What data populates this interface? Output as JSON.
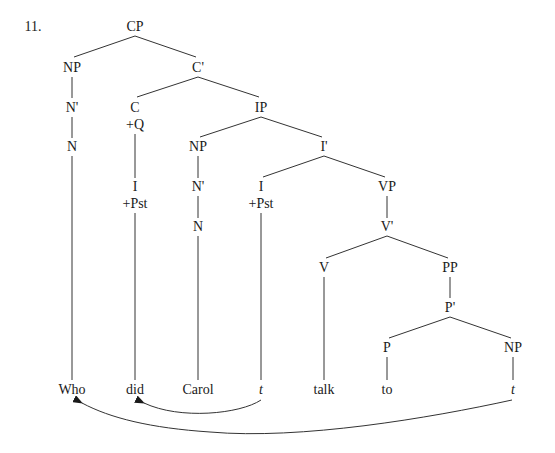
{
  "example_number": "11.",
  "colors": {
    "line": "#333333",
    "text": "#1a1a1a",
    "background": "#ffffff"
  },
  "nodes": {
    "cp": {
      "label": "CP",
      "x": 135,
      "y": 27
    },
    "np_spec_cp": {
      "label": "NP",
      "x": 72,
      "y": 68
    },
    "c_bar": {
      "label": "C'",
      "x": 198,
      "y": 68
    },
    "n_bar_who": {
      "label": "N'",
      "x": 72,
      "y": 108
    },
    "c": {
      "label": "C",
      "x": 135,
      "y": 108
    },
    "c_feature": {
      "label": "+Q",
      "x": 135,
      "y": 125
    },
    "ip": {
      "label": "IP",
      "x": 261,
      "y": 108
    },
    "n_who": {
      "label": "N",
      "x": 72,
      "y": 147
    },
    "np_subj": {
      "label": "NP",
      "x": 198,
      "y": 147
    },
    "i_bar": {
      "label": "I'",
      "x": 324,
      "y": 147
    },
    "i_moved": {
      "label": "I",
      "x": 135,
      "y": 187
    },
    "i_moved_feature": {
      "label": "+Pst",
      "x": 135,
      "y": 204
    },
    "n_bar_carol": {
      "label": "N'",
      "x": 198,
      "y": 187
    },
    "i": {
      "label": "I",
      "x": 261,
      "y": 187
    },
    "i_feature": {
      "label": "+Pst",
      "x": 261,
      "y": 204
    },
    "vp": {
      "label": "VP",
      "x": 387,
      "y": 187
    },
    "n_carol": {
      "label": "N",
      "x": 198,
      "y": 227
    },
    "v_bar": {
      "label": "V'",
      "x": 387,
      "y": 227
    },
    "v": {
      "label": "V",
      "x": 324,
      "y": 268
    },
    "pp": {
      "label": "PP",
      "x": 450,
      "y": 268
    },
    "p_bar": {
      "label": "P'",
      "x": 450,
      "y": 308
    },
    "p": {
      "label": "P",
      "x": 387,
      "y": 348
    },
    "np_obj": {
      "label": "NP",
      "x": 513,
      "y": 348
    }
  },
  "leaves": [
    {
      "id": "leaf_who",
      "text": "Who",
      "x": 72,
      "y": 390,
      "italic": false
    },
    {
      "id": "leaf_did",
      "text": "did",
      "x": 135,
      "y": 390,
      "italic": false
    },
    {
      "id": "leaf_carol",
      "text": "Carol",
      "x": 198,
      "y": 390,
      "italic": false
    },
    {
      "id": "leaf_trace_i",
      "text": "t",
      "x": 261,
      "y": 390,
      "italic": true
    },
    {
      "id": "leaf_talk",
      "text": "talk",
      "x": 324,
      "y": 390,
      "italic": false
    },
    {
      "id": "leaf_to",
      "text": "to",
      "x": 387,
      "y": 390,
      "italic": false
    },
    {
      "id": "leaf_trace_np",
      "text": "t",
      "x": 513,
      "y": 390,
      "italic": true
    }
  ],
  "movements": [
    {
      "from": "leaf_trace_i",
      "to": "leaf_did",
      "description": "I-to-C movement"
    },
    {
      "from": "leaf_trace_np",
      "to": "leaf_who",
      "description": "wh-movement"
    }
  ],
  "sentence": "Who did Carol t talk to t"
}
